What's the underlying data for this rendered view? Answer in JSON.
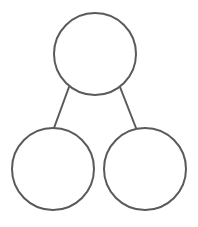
{
  "diagram": {
    "type": "tree",
    "stroke_color": "#5a5a5a",
    "fill_color": "#ffffff",
    "background": "#ffffff",
    "stroke_width": 2,
    "nodes": [
      {
        "id": "root",
        "label": "",
        "cx": 95,
        "cy": 54,
        "r": 41
      },
      {
        "id": "left-child",
        "label": "",
        "cx": 53,
        "cy": 169,
        "r": 41
      },
      {
        "id": "right-child",
        "label": "",
        "cx": 145,
        "cy": 169,
        "r": 41
      }
    ],
    "edges": [
      {
        "from": "root",
        "to": "left-child",
        "x1": 69,
        "y1": 87,
        "x2": 54,
        "y2": 128
      },
      {
        "from": "root",
        "to": "right-child",
        "x1": 120,
        "y1": 87,
        "x2": 136,
        "y2": 128
      }
    ]
  }
}
